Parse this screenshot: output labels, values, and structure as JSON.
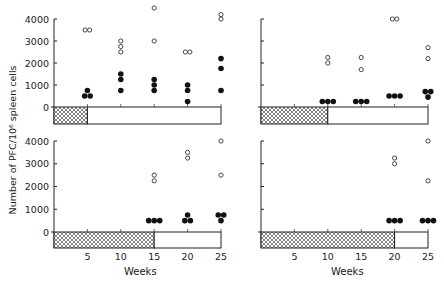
{
  "chart_data": [
    {
      "type": "scatter",
      "panel": "top-left",
      "ylabel": "Number of PFC/10^6 spleen cells",
      "xlabel": "",
      "ylim": [
        0,
        4000
      ],
      "yticks": [
        0,
        1000,
        2000,
        3000,
        4000
      ],
      "xlim": [
        0,
        25
      ],
      "xticks": [
        5,
        10,
        15,
        20,
        25
      ],
      "hatched_until_week": 5,
      "series": [
        {
          "name": "open circles",
          "marker": "open",
          "points": [
            [
              5,
              3500
            ],
            [
              5,
              3500
            ],
            [
              10,
              3000
            ],
            [
              10,
              2750
            ],
            [
              10,
              2500
            ],
            [
              15,
              4500
            ],
            [
              15,
              3000
            ],
            [
              20,
              2500
            ],
            [
              20,
              2500
            ],
            [
              25,
              4200
            ],
            [
              25,
              4000
            ]
          ]
        },
        {
          "name": "filled circles",
          "marker": "filled",
          "points": [
            [
              5,
              500
            ],
            [
              5,
              750
            ],
            [
              5,
              500
            ],
            [
              10,
              1500
            ],
            [
              10,
              1250
            ],
            [
              10,
              750
            ],
            [
              15,
              1250
            ],
            [
              15,
              1000
            ],
            [
              15,
              750
            ],
            [
              20,
              1000
            ],
            [
              20,
              750
            ],
            [
              20,
              250
            ],
            [
              25,
              2200
            ],
            [
              25,
              1750
            ],
            [
              25,
              750
            ]
          ]
        }
      ]
    },
    {
      "type": "scatter",
      "panel": "top-right",
      "ylim": [
        0,
        4000
      ],
      "xlim": [
        0,
        25
      ],
      "hatched_until_week": 10,
      "series": [
        {
          "name": "open circles",
          "marker": "open",
          "points": [
            [
              10,
              2250
            ],
            [
              10,
              2000
            ],
            [
              15,
              2250
            ],
            [
              15,
              1700
            ],
            [
              20,
              4000
            ],
            [
              20,
              4000
            ],
            [
              25,
              2700
            ],
            [
              25,
              2200
            ]
          ]
        },
        {
          "name": "filled circles",
          "marker": "filled",
          "points": [
            [
              10,
              250
            ],
            [
              10,
              250
            ],
            [
              10,
              250
            ],
            [
              15,
              250
            ],
            [
              15,
              250
            ],
            [
              15,
              250
            ],
            [
              20,
              500
            ],
            [
              20,
              500
            ],
            [
              20,
              500
            ],
            [
              25,
              700
            ],
            [
              25,
              700
            ],
            [
              25,
              450
            ]
          ]
        }
      ]
    },
    {
      "type": "scatter",
      "panel": "bottom-left",
      "ylabel": "Number of PFC/10^6 spleen cells",
      "xlabel": "Weeks",
      "ylim": [
        0,
        4000
      ],
      "yticks": [
        0,
        1000,
        2000,
        3000,
        4000
      ],
      "xlim": [
        0,
        25
      ],
      "xticks": [
        5,
        10,
        15,
        20,
        25
      ],
      "hatched_until_week": 15,
      "series": [
        {
          "name": "open circles",
          "marker": "open",
          "points": [
            [
              15,
              2500
            ],
            [
              15,
              2250
            ],
            [
              20,
              3500
            ],
            [
              20,
              3250
            ],
            [
              25,
              4000
            ],
            [
              25,
              2500
            ]
          ]
        },
        {
          "name": "filled circles",
          "marker": "filled",
          "points": [
            [
              15,
              500
            ],
            [
              15,
              500
            ],
            [
              15,
              500
            ],
            [
              20,
              500
            ],
            [
              20,
              500
            ],
            [
              20,
              750
            ],
            [
              25,
              750
            ],
            [
              25,
              750
            ],
            [
              25,
              500
            ]
          ]
        }
      ]
    },
    {
      "type": "scatter",
      "panel": "bottom-right",
      "xlabel": "Weeks",
      "ylim": [
        0,
        4000
      ],
      "xlim": [
        0,
        25
      ],
      "xticks": [
        5,
        10,
        15,
        20,
        25
      ],
      "hatched_until_week": 20,
      "series": [
        {
          "name": "open circles",
          "marker": "open",
          "points": [
            [
              20,
              3250
            ],
            [
              20,
              3000
            ],
            [
              25,
              4000
            ],
            [
              25,
              2250
            ]
          ]
        },
        {
          "name": "filled circles",
          "marker": "filled",
          "points": [
            [
              20,
              500
            ],
            [
              20,
              500
            ],
            [
              20,
              500
            ],
            [
              25,
              500
            ],
            [
              25,
              500
            ],
            [
              25,
              500
            ]
          ]
        }
      ]
    }
  ],
  "labels": {
    "ylabel": "Number of PFC/10⁶ spleen cells",
    "xlabel": "Weeks",
    "yticks": [
      "0",
      "1000",
      "2000",
      "3000",
      "4000"
    ],
    "xticks": [
      "5",
      "10",
      "15",
      "20",
      "25"
    ]
  }
}
